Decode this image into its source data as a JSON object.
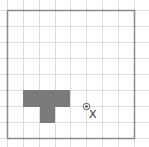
{
  "diagram": {
    "type": "grid-puzzle",
    "grid": {
      "columns": 8,
      "rows": 8,
      "cell_size_px": 16,
      "origin_px": [
        7,
        10
      ],
      "line_color": "#dcdcdc",
      "border_color": "#8a8a8a"
    },
    "shape": {
      "name": "T-tetromino-like",
      "fill": "#7a7a7a",
      "cells": [
        [
          1,
          5
        ],
        [
          2,
          5
        ],
        [
          3,
          5
        ],
        [
          2,
          6
        ]
      ]
    },
    "marker": {
      "name": "center-point",
      "grid_position": [
        5,
        6
      ],
      "label": "X"
    }
  }
}
